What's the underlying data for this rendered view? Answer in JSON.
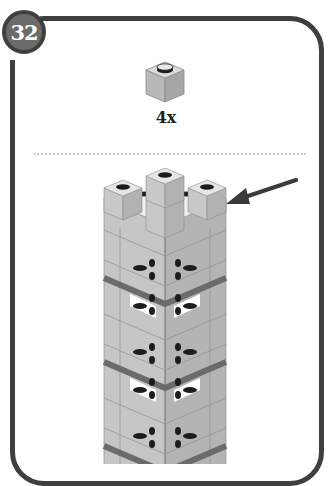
{
  "step": {
    "number": "32"
  },
  "parts_list": {
    "items": [
      {
        "part": "brick-1x1",
        "color": "light-gray",
        "quantity": "4x"
      }
    ]
  },
  "assembly": {
    "description": "Tower with four 1x1 bricks placed on corners of top layer",
    "callout": "arrow pointing to newly placed 1x1 brick"
  },
  "colors": {
    "frame": "#3f3f3f",
    "badge_fill": "#6a6a6a",
    "brick_light": "#c4c4c4",
    "brick_mid": "#b0b0b0",
    "brick_dark": "#9a9a9a",
    "band": "#6b6b6b",
    "stud": "#1c1c1c"
  }
}
